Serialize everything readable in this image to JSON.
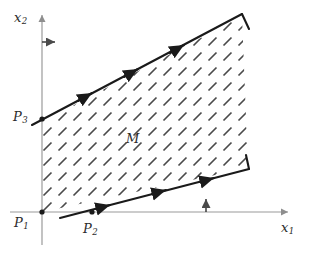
{
  "figure": {
    "background_color": "#ffffff",
    "width": 313,
    "height": 258,
    "axis_color": "#9a9a9a",
    "boundary_color": "#1a1a1a",
    "hatch_color": "#4a4a4a",
    "label_color": "#2b2b2b"
  },
  "axes": {
    "x_axis": {
      "label": "x",
      "subscript": "1",
      "origin_px": [
        42,
        212
      ],
      "tip_px": [
        291,
        212
      ]
    },
    "y_axis": {
      "label": "x",
      "subscript": "2",
      "origin_px": [
        42,
        212
      ],
      "tip_px": [
        42,
        12
      ]
    }
  },
  "points": [
    {
      "id": "P1",
      "label": "P",
      "subscript": "1",
      "x_px": 42,
      "y_px": 212
    },
    {
      "id": "P2",
      "label": "P",
      "subscript": "2",
      "x_px": 92,
      "y_px": 212
    },
    {
      "id": "P3",
      "label": "P",
      "subscript": "3",
      "x_px": 42,
      "y_px": 119
    }
  ],
  "region": {
    "label": "M",
    "label_x_px": 126,
    "label_y_px": 132,
    "hatch_angle_deg": 45,
    "hatch_spacing_px": 15
  },
  "direction_arrows": [
    {
      "id": "horizontal-normal-arrow",
      "from_px": [
        42,
        42
      ],
      "to_px": [
        58,
        42
      ]
    },
    {
      "id": "vertical-normal-arrow",
      "from_px": [
        206,
        212
      ],
      "to_px": [
        206,
        196
      ]
    }
  ],
  "boundary_lines": {
    "upper": {
      "from_px": [
        32,
        125
      ],
      "to_px": [
        242,
        14
      ]
    },
    "lower": {
      "from_px": [
        60,
        218
      ],
      "to_px": [
        249,
        169
      ]
    },
    "upper_notch": {
      "from_px": [
        242,
        14
      ],
      "to_px": [
        249,
        29
      ]
    },
    "lower_notch": {
      "from_px": [
        246,
        155
      ],
      "to_px": [
        249,
        169
      ]
    }
  }
}
